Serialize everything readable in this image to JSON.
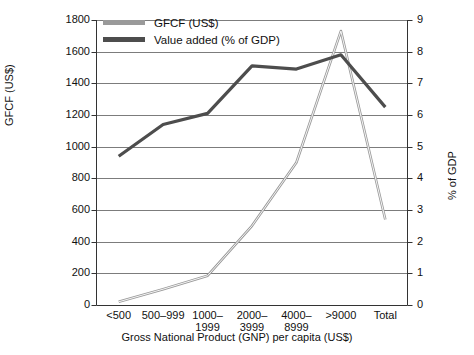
{
  "chart_data": {
    "type": "line",
    "title": "",
    "categories": [
      "<500",
      "500–999",
      "1000–1999",
      "2000–3999",
      "4000–8999",
      ">9000",
      "Total"
    ],
    "xlabel": "Gross National Product (GNP) per capita (US$)",
    "series": [
      {
        "name": "GFCF (US$)",
        "axis": "left",
        "color": "#9a9a9a",
        "values": [
          20,
          100,
          185,
          500,
          900,
          1730,
          540
        ]
      },
      {
        "name": "Value added (% of GDP)",
        "axis": "right",
        "color": "#4d4d4d",
        "values": [
          4.7,
          5.7,
          6.05,
          7.55,
          7.45,
          7.9,
          6.25
        ]
      }
    ],
    "left_axis": {
      "label": "GFCF (US$)",
      "min": 0,
      "max": 1800,
      "step": 200,
      "ticks": [
        "0",
        "200",
        "400",
        "600",
        "800",
        "1000",
        "1200",
        "1400",
        "1600",
        "1800"
      ]
    },
    "right_axis": {
      "label": "% of GDP",
      "min": 0,
      "max": 9,
      "step": 1,
      "ticks": [
        "0",
        "1",
        "2",
        "3",
        "4",
        "5",
        "6",
        "7",
        "8",
        "9"
      ]
    },
    "grid": true,
    "legend_position": "top-left",
    "legend": [
      {
        "label": "GFCF (US$)",
        "color": "#9a9a9a"
      },
      {
        "label": "Value added (% of GDP)",
        "color": "#4d4d4d"
      }
    ]
  }
}
